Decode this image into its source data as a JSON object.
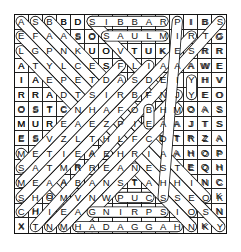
{
  "puzzle": {
    "type": "word-search",
    "rows": 15,
    "cols": 15,
    "grid": [
      [
        "A",
        "S",
        "B",
        "B",
        "D",
        "S",
        "I",
        "B",
        "B",
        "A",
        "R",
        "P",
        "I",
        "B",
        "S"
      ],
      [
        "E",
        "F",
        "A",
        "A",
        "S",
        "O",
        "S",
        "A",
        "U",
        "L",
        "M",
        "I",
        "R",
        "T",
        "G"
      ],
      [
        "L",
        "G",
        "P",
        "N",
        "K",
        "U",
        "O",
        "V",
        "T",
        "U",
        "K",
        "E",
        "S",
        "R",
        "R"
      ],
      [
        "A",
        "T",
        "Y",
        "L",
        "C",
        "E",
        "S",
        "F",
        "L",
        "I",
        "A",
        "A",
        "A",
        "W",
        "E"
      ],
      [
        "I",
        "A",
        "E",
        "P",
        "E",
        "T",
        "D",
        "A",
        "S",
        "D",
        "E",
        "I",
        "Y",
        "H",
        "V"
      ],
      [
        "R",
        "R",
        "A",
        "D",
        "T",
        "S",
        "I",
        "R",
        "B",
        "F",
        "N",
        "J",
        "Y",
        "E",
        "O"
      ],
      [
        "O",
        "S",
        "T",
        "C",
        "N",
        "H",
        "A",
        "F",
        "O",
        "B",
        "H",
        "M",
        "O",
        "A",
        "S"
      ],
      [
        "M",
        "U",
        "R",
        "E",
        "A",
        "E",
        "Z",
        "P",
        "I",
        "E",
        "A",
        "A",
        "J",
        "T",
        "S"
      ],
      [
        "E",
        "S",
        "V",
        "Z",
        "L",
        "T",
        "H",
        "L",
        "F",
        "C",
        "D",
        "T",
        "R",
        "Z",
        "A"
      ],
      [
        "M",
        "E",
        "T",
        "I",
        "E",
        "A",
        "E",
        "H",
        "R",
        "I",
        "A",
        "A",
        "H",
        "O",
        "P"
      ],
      [
        "S",
        "A",
        "T",
        "M",
        "R",
        "R",
        "E",
        "A",
        "N",
        "E",
        "S",
        "T",
        "E",
        "Q",
        "H"
      ],
      [
        "M",
        "E",
        "A",
        "A",
        "B",
        "A",
        "N",
        "S",
        "T",
        "A",
        "H",
        "H",
        "I",
        "N",
        "C"
      ],
      [
        "S",
        "H",
        "O",
        "M",
        "V",
        "N",
        "W",
        "P",
        "U",
        "C",
        "S",
        "S",
        "E",
        "O",
        "K"
      ],
      [
        "C",
        "H",
        "I",
        "E",
        "A",
        "G",
        "N",
        "I",
        "R",
        "P",
        "S",
        "I",
        "O",
        "S",
        "N"
      ],
      [
        "X",
        "T",
        "N",
        "M",
        "H",
        "A",
        "D",
        "A",
        "G",
        "G",
        "A",
        "H",
        "N",
        "K",
        "Y"
      ]
    ],
    "found_word_marks": [
      {
        "dir": "diag-down-right",
        "from": [
          0,
          0
        ],
        "to": [
          14,
          14
        ]
      },
      {
        "dir": "diag-down-right",
        "from": [
          0,
          1
        ],
        "to": [
          12,
          13
        ]
      },
      {
        "dir": "diag-down-right",
        "from": [
          0,
          2
        ],
        "to": [
          6,
          8
        ]
      },
      {
        "dir": "diag-down-right",
        "from": [
          1,
          0
        ],
        "to": [
          13,
          12
        ]
      },
      {
        "dir": "diag-down-right",
        "from": [
          0,
          5
        ],
        "to": [
          6,
          11
        ]
      },
      {
        "dir": "diag-down-right",
        "from": [
          2,
          0
        ],
        "to": [
          14,
          12
        ]
      },
      {
        "dir": "diag-down-right",
        "from": [
          9,
          0
        ],
        "to": [
          14,
          5
        ]
      },
      {
        "dir": "diag-up-right",
        "from": [
          14,
          1
        ],
        "to": [
          0,
          14
        ]
      },
      {
        "dir": "diag-up-right",
        "from": [
          13,
          0
        ],
        "to": [
          1,
          12
        ]
      },
      {
        "dir": "diag-up-right",
        "from": [
          12,
          0
        ],
        "to": [
          3,
          9
        ]
      },
      {
        "dir": "diag-up-right",
        "from": [
          11,
          0
        ],
        "to": [
          4,
          7
        ]
      },
      {
        "dir": "diag-up-right",
        "from": [
          10,
          0
        ],
        "to": [
          3,
          7
        ]
      },
      {
        "dir": "diag-up-right",
        "from": [
          14,
          2
        ],
        "to": [
          5,
          11
        ]
      },
      {
        "dir": "diag-up-right",
        "from": [
          14,
          3
        ],
        "to": [
          7,
          10
        ]
      },
      {
        "dir": "diag-up-right",
        "from": [
          14,
          4
        ],
        "to": [
          10,
          8
        ]
      },
      {
        "dir": "diag-up-right",
        "from": [
          12,
          10
        ],
        "to": [
          0,
          11
        ]
      },
      {
        "dir": "horizontal",
        "from": [
          0,
          5
        ],
        "to": [
          0,
          10
        ]
      },
      {
        "dir": "horizontal",
        "from": [
          1,
          6
        ],
        "to": [
          1,
          10
        ]
      },
      {
        "dir": "horizontal",
        "from": [
          12,
          7
        ],
        "to": [
          12,
          9
        ]
      },
      {
        "dir": "horizontal",
        "from": [
          13,
          5
        ],
        "to": [
          13,
          10
        ]
      },
      {
        "dir": "horizontal",
        "from": [
          14,
          4
        ],
        "to": [
          14,
          11
        ]
      },
      {
        "dir": "vertical",
        "from": [
          4,
          12
        ],
        "to": [
          5,
          12
        ]
      },
      {
        "dir": "vertical",
        "from": [
          6,
          9
        ],
        "to": [
          7,
          9
        ]
      }
    ]
  }
}
